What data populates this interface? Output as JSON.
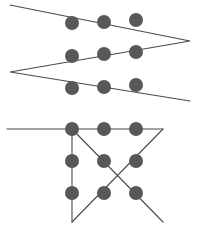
{
  "figure": {
    "canvas": {
      "width": 200,
      "height": 231,
      "background": "#ffffff"
    },
    "style": {
      "dot_color": "#585858",
      "line_color": "#4a4a4a",
      "dot_radius": 7,
      "line_width": 1.1
    },
    "panels": [
      {
        "name": "top-zigzag-solution",
        "label": "Zigzag four-line solution",
        "grid": {
          "columns_x": [
            72,
            104,
            136
          ],
          "rows_y": [
            23,
            55,
            87
          ],
          "dots": [
            {
              "id": "t1",
              "cx": 72,
              "cy": 23
            },
            {
              "id": "t2",
              "cx": 104,
              "cy": 22
            },
            {
              "id": "t3",
              "cx": 136,
              "cy": 20
            },
            {
              "id": "t4",
              "cx": 72,
              "cy": 56
            },
            {
              "id": "t5",
              "cx": 104,
              "cy": 54
            },
            {
              "id": "t6",
              "cx": 136,
              "cy": 52
            },
            {
              "id": "t7",
              "cx": 72,
              "cy": 88
            },
            {
              "id": "t8",
              "cx": 104,
              "cy": 87
            },
            {
              "id": "t9",
              "cx": 136,
              "cy": 85
            }
          ]
        },
        "path": {
          "name": "zigzag-path",
          "points": [
            {
              "x": 10,
              "y": 5
            },
            {
              "x": 190,
              "y": 41
            },
            {
              "x": 10,
              "y": 72
            },
            {
              "x": 190,
              "y": 101
            }
          ]
        }
      },
      {
        "name": "bottom-triangle-solution",
        "label": "Triangle and cross four-line solution",
        "grid": {
          "columns_x": [
            72,
            104,
            136
          ],
          "rows_y": [
            129,
            161,
            193
          ],
          "dots": [
            {
              "id": "b1",
              "cx": 72,
              "cy": 129
            },
            {
              "id": "b2",
              "cx": 104,
              "cy": 129
            },
            {
              "id": "b3",
              "cx": 136,
              "cy": 129
            },
            {
              "id": "b4",
              "cx": 72,
              "cy": 161
            },
            {
              "id": "b5",
              "cx": 104,
              "cy": 161
            },
            {
              "id": "b6",
              "cx": 136,
              "cy": 161
            },
            {
              "id": "b7",
              "cx": 72,
              "cy": 193
            },
            {
              "id": "b8",
              "cx": 104,
              "cy": 193
            },
            {
              "id": "b9",
              "cx": 136,
              "cy": 193
            }
          ]
        },
        "segments": [
          {
            "name": "horizontal-top-line",
            "points": [
              {
                "x": 7,
                "y": 129
              },
              {
                "x": 163,
                "y": 129
              }
            ]
          },
          {
            "name": "vertical-left-line",
            "points": [
              {
                "x": 72,
                "y": 129
              },
              {
                "x": 72,
                "y": 222
              }
            ]
          },
          {
            "name": "diagonal-down-right",
            "points": [
              {
                "x": 72,
                "y": 129
              },
              {
                "x": 163,
                "y": 222
              }
            ]
          },
          {
            "name": "diagonal-up-right",
            "points": [
              {
                "x": 72,
                "y": 222
              },
              {
                "x": 163,
                "y": 129
              }
            ]
          }
        ]
      }
    ]
  }
}
